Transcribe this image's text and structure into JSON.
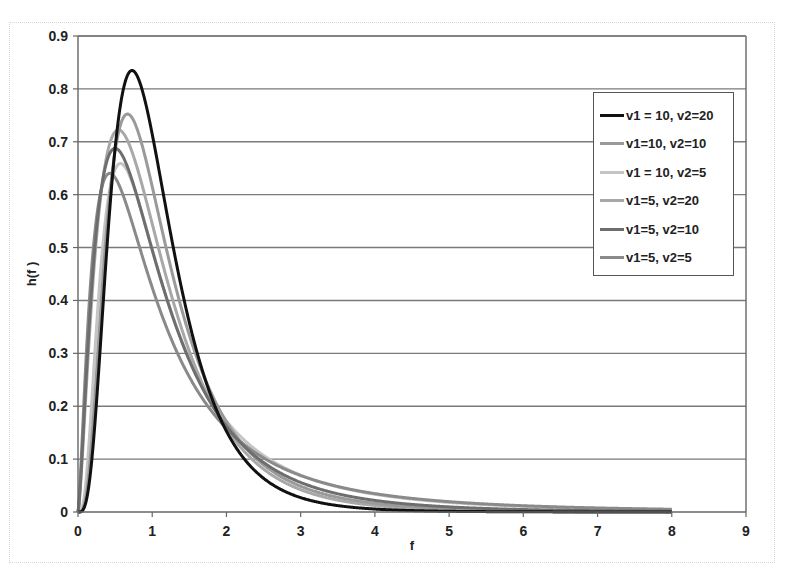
{
  "chart_data": {
    "type": "line",
    "title": "",
    "xlabel": "f",
    "ylabel": "h(f )",
    "xlim": [
      0,
      9
    ],
    "ylim": [
      0,
      0.9
    ],
    "x_ticks": [
      "0",
      "1",
      "2",
      "3",
      "4",
      "5",
      "6",
      "7",
      "8",
      "9"
    ],
    "y_ticks": [
      "0",
      "0.1",
      "0.2",
      "0.3",
      "0.4",
      "0.5",
      "0.6",
      "0.7",
      "0.8",
      "0.9"
    ],
    "grid": {
      "horizontal": true,
      "vertical": false
    },
    "legend_position": "upper right, inside plot",
    "x_range_plotted": [
      0,
      8
    ],
    "series": [
      {
        "name": "v1 = 10, v2=20",
        "v1": 10,
        "v2": 20,
        "color": "#111111",
        "peak": {
          "x": 0.75,
          "y": 0.835
        },
        "x": [
          0.25,
          0.5,
          0.75,
          1,
          1.5,
          2,
          3,
          4,
          5,
          8
        ],
        "values": [
          0.186,
          0.697,
          0.835,
          0.716,
          0.359,
          0.142,
          0.022,
          0.004,
          0.001,
          0.0
        ]
      },
      {
        "name": "v1=10, v2=10",
        "v1": 10,
        "v2": 10,
        "color": "#9a9a9a",
        "peak": {
          "x": 0.67,
          "y": 0.75
        },
        "x": [
          0.25,
          0.5,
          0.75,
          1,
          1.5,
          2,
          3,
          4,
          5,
          8
        ],
        "values": [
          0.29,
          0.69,
          0.74,
          0.62,
          0.35,
          0.18,
          0.06,
          0.02,
          0.01,
          0.002
        ]
      },
      {
        "name": "v1 = 10, v2=5",
        "v1": 10,
        "v2": 5,
        "color": "#c4c4c4",
        "peak": {
          "x": 0.57,
          "y": 0.655
        },
        "x": [
          0.25,
          0.5,
          0.75,
          1,
          1.5,
          2,
          3,
          4,
          5,
          8
        ],
        "values": [
          0.37,
          0.65,
          0.62,
          0.5,
          0.3,
          0.18,
          0.07,
          0.035,
          0.02,
          0.005
        ]
      },
      {
        "name": "v1=5, v2=20",
        "v1": 5,
        "v2": 20,
        "color": "#a8a8a8",
        "peak": {
          "x": 0.55,
          "y": 0.72
        },
        "x": [
          0.25,
          0.5,
          0.75,
          1,
          1.5,
          2,
          3,
          4,
          5,
          8
        ],
        "values": [
          0.57,
          0.72,
          0.64,
          0.51,
          0.28,
          0.14,
          0.035,
          0.01,
          0.003,
          0.0
        ]
      },
      {
        "name": "v1=5, v2=10",
        "v1": 5,
        "v2": 10,
        "color": "#6e6e6e",
        "peak": {
          "x": 0.5,
          "y": 0.687
        },
        "x": [
          0.25,
          0.5,
          0.75,
          1,
          1.5,
          2,
          3,
          4,
          5,
          8
        ],
        "values": [
          0.57,
          0.687,
          0.62,
          0.5,
          0.3,
          0.16,
          0.06,
          0.02,
          0.01,
          0.002
        ]
      },
      {
        "name": "v1=5, v2=5",
        "v1": 5,
        "v2": 5,
        "color": "#8a8a8a",
        "peak": {
          "x": 0.43,
          "y": 0.64
        },
        "x": [
          0.25,
          0.5,
          0.75,
          1,
          1.5,
          2,
          3,
          4,
          5,
          8
        ],
        "values": [
          0.58,
          0.63,
          0.55,
          0.46,
          0.3,
          0.19,
          0.08,
          0.04,
          0.02,
          0.005
        ]
      }
    ]
  }
}
